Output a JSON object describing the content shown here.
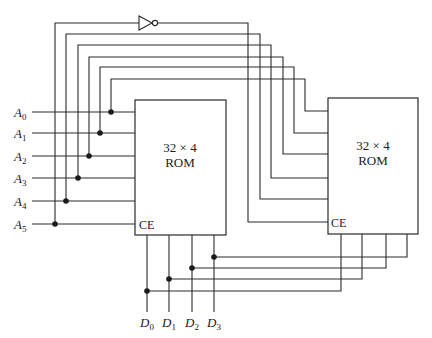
{
  "diagram": {
    "title": "",
    "address_inputs": [
      {
        "name": "A",
        "sub": "0"
      },
      {
        "name": "A",
        "sub": "1"
      },
      {
        "name": "A",
        "sub": "2"
      },
      {
        "name": "A",
        "sub": "3"
      },
      {
        "name": "A",
        "sub": "4"
      },
      {
        "name": "A",
        "sub": "5"
      }
    ],
    "data_outputs": [
      {
        "name": "D",
        "sub": "0"
      },
      {
        "name": "D",
        "sub": "1"
      },
      {
        "name": "D",
        "sub": "2"
      },
      {
        "name": "D",
        "sub": "3"
      }
    ],
    "roms": [
      {
        "size": "32 × 4",
        "type": "ROM",
        "enable": "CE"
      },
      {
        "size": "32 × 4",
        "type": "ROM",
        "enable": "CE"
      }
    ],
    "inverter": {
      "input": "A5",
      "output": "CE of ROM 2"
    },
    "colors": {
      "line": "#2a2a2a",
      "background": "#ffffff"
    }
  }
}
